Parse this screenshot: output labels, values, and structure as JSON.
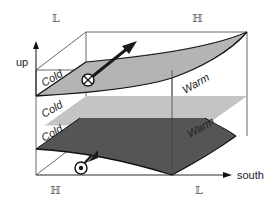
{
  "diagram": {
    "corner_labels": {
      "top_left": "𝕃",
      "top_right": "ℍ",
      "bottom_left": "ℍ",
      "bottom_right": "𝕃"
    },
    "axes": {
      "vertical": "up",
      "horizontal": "south"
    },
    "layers": [
      {
        "name": "upper",
        "left_label": "Cold",
        "right_label": "Warm",
        "fill": "#b4b4b4",
        "shape": "curved"
      },
      {
        "name": "middle",
        "left_label": "Cold",
        "right_label": "Warm",
        "fill": "#c4c4c4",
        "shape": "flat"
      },
      {
        "name": "lower",
        "left_label": "Cold",
        "right_label": "Warm",
        "fill": "#555555",
        "shape": "curved"
      }
    ],
    "symbols": [
      {
        "name": "upper-flow",
        "glyph": "circle-cross",
        "meaning": "flow into page, tilted upward-right"
      },
      {
        "name": "lower-flow",
        "glyph": "circle-dot",
        "meaning": "flow out of page, tilted downward-left"
      }
    ],
    "colors": {
      "box_line": "#333333",
      "upper_surface": "#b4b4b4",
      "middle_surface": "#c4c4c4",
      "lower_surface": "#555555",
      "arrow": "#1a1a1a"
    }
  }
}
